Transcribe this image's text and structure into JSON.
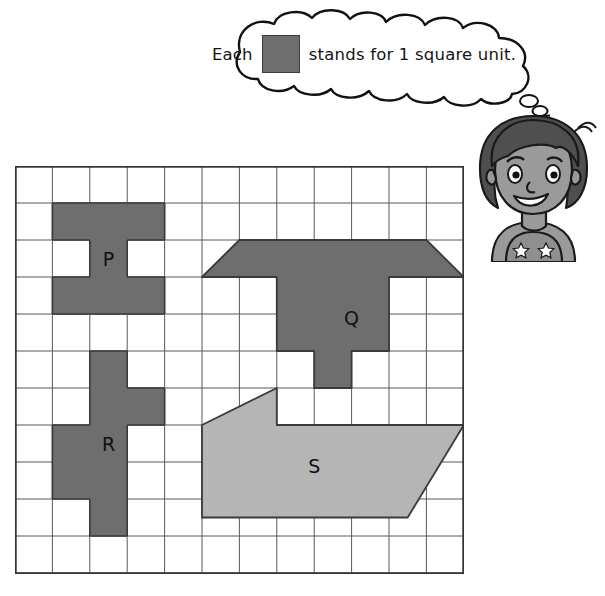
{
  "legend": {
    "text_before": "Each",
    "text_after": "stands for 1 square unit.",
    "swatch_icon": "gray-square-swatch",
    "swatch_color": "#6e6e6e",
    "swatch_border_color": "#3d3d3d"
  },
  "illustration": {
    "name": "cartoon-girl",
    "description": "smiling girl with dark hair wearing a star-patterned tank top",
    "hair_color": "#4f4f4f",
    "skin_color": "#9a9a9a",
    "shirt_color": "#8f8f8f",
    "outline_color": "#1a1a1a"
  },
  "grid": {
    "columns": 12,
    "rows": 11,
    "cell_width": 37.4,
    "cell_height": 37.0,
    "line_color": "#595959",
    "border_color": "#333333",
    "background": "#ffffff"
  },
  "colors": {
    "shape_dark": "#6e6e6e",
    "shape_light": "#b5b5b5",
    "shape_outline": "#3a3a3a",
    "label_text": "#111111"
  },
  "shapes": [
    {
      "label": "P",
      "fill": "#6e6e6e",
      "label_cell": [
        2,
        2
      ],
      "type": "polyomino",
      "cells": [
        [
          1,
          1
        ],
        [
          2,
          1
        ],
        [
          3,
          1
        ],
        [
          2,
          2
        ],
        [
          1,
          3
        ],
        [
          2,
          3
        ],
        [
          3,
          3
        ]
      ],
      "area_units": 7
    },
    {
      "label": "Q",
      "fill": "#6e6e6e",
      "label_cell": [
        8.5,
        3.6
      ],
      "type": "polygon",
      "points_cells": [
        [
          6.0,
          2.0
        ],
        [
          11.0,
          2.0
        ],
        [
          12.0,
          3.0
        ],
        [
          10.0,
          3.0
        ],
        [
          10.0,
          5.0
        ],
        [
          9.0,
          5.0
        ],
        [
          9.0,
          6.0
        ],
        [
          8.0,
          6.0
        ],
        [
          8.0,
          5.0
        ],
        [
          7.0,
          5.0
        ],
        [
          7.0,
          3.0
        ],
        [
          5.0,
          3.0
        ]
      ],
      "area_units": 11
    },
    {
      "label": "R",
      "fill": "#6e6e6e",
      "label_cell": [
        2,
        7
      ],
      "type": "polyomino",
      "cells": [
        [
          2,
          5
        ],
        [
          2,
          6
        ],
        [
          3,
          6
        ],
        [
          1,
          7
        ],
        [
          2,
          7
        ],
        [
          1,
          8
        ],
        [
          2,
          8
        ],
        [
          2,
          9
        ]
      ],
      "area_units": 8
    },
    {
      "label": "S",
      "fill": "#b5b5b5",
      "label_cell": [
        7.5,
        7.6
      ],
      "type": "polygon",
      "points_cells": [
        [
          5.0,
          7.0
        ],
        [
          7.0,
          6.0
        ],
        [
          7.0,
          7.0
        ],
        [
          12.0,
          7.0
        ],
        [
          10.5,
          9.5
        ],
        [
          5.0,
          9.5
        ]
      ],
      "area_units": 14
    }
  ]
}
